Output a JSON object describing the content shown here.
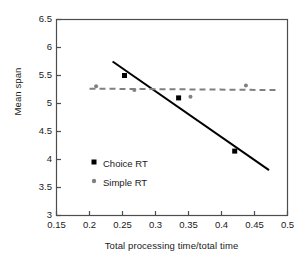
{
  "chart_data": {
    "type": "scatter",
    "title": "",
    "xlabel": "Total processing time/total time",
    "ylabel": "Mean span",
    "xlim": [
      0.15,
      0.5
    ],
    "ylim": [
      3,
      6.5
    ],
    "xticks": [
      "0.15",
      "0.2",
      "0.25",
      "0.3",
      "0.35",
      "0.4",
      "0.45",
      "0.5"
    ],
    "xtick_values": [
      0.15,
      0.2,
      0.25,
      0.3,
      0.35,
      0.4,
      0.45,
      0.5
    ],
    "yticks": [
      "3",
      "3.5",
      "4",
      "4.5",
      "5",
      "5.5",
      "6",
      "6.5"
    ],
    "ytick_values": [
      3,
      3.5,
      4,
      4.5,
      5,
      5.5,
      6,
      6.5
    ],
    "grid": false,
    "legend_position": "inside-left-lower",
    "series": [
      {
        "name": "Choice RT",
        "marker": "square",
        "color": "#000000",
        "marker_size": 5,
        "points": [
          {
            "x": 0.253,
            "y": 5.5
          },
          {
            "x": 0.335,
            "y": 5.1
          },
          {
            "x": 0.42,
            "y": 4.15
          }
        ],
        "fit_line": {
          "style": "solid",
          "color": "#000000",
          "width": 2,
          "x1": 0.235,
          "y1": 5.75,
          "x2": 0.472,
          "y2": 3.81
        }
      },
      {
        "name": "Simple RT",
        "marker": "circle",
        "color": "#808080",
        "marker_size": 4,
        "points": [
          {
            "x": 0.21,
            "y": 5.31
          },
          {
            "x": 0.268,
            "y": 5.24
          },
          {
            "x": 0.353,
            "y": 5.12
          },
          {
            "x": 0.437,
            "y": 5.32
          }
        ],
        "fit_line": {
          "style": "dashed",
          "color": "#808080",
          "width": 2,
          "x1": 0.2,
          "y1": 5.265,
          "x2": 0.488,
          "y2": 5.24
        }
      }
    ]
  },
  "legend": {
    "entries": [
      {
        "label": "Choice RT",
        "marker": "square",
        "color": "#000000"
      },
      {
        "label": "Simple RT",
        "marker": "circle",
        "color": "#808080"
      }
    ]
  },
  "axes": {
    "frame_color": "#4d4d4d",
    "text_color": "#1a1a1a"
  }
}
